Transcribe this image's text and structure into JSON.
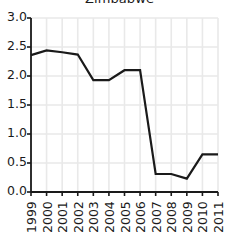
{
  "chart_data": {
    "type": "line",
    "title": "Zimbabwe",
    "xlabel": "",
    "ylabel": "",
    "x": [
      1999,
      2000,
      2001,
      2002,
      2003,
      2004,
      2005,
      2006,
      2007,
      2008,
      2009,
      2010,
      2011
    ],
    "categories": [
      "1999",
      "2000",
      "2001",
      "2002",
      "2003",
      "2004",
      "2005",
      "2006",
      "2007",
      "2008",
      "2009",
      "2010",
      "2011"
    ],
    "values": [
      2.36,
      2.44,
      2.41,
      2.37,
      1.93,
      1.93,
      2.1,
      2.1,
      0.31,
      0.31,
      0.23,
      0.65,
      0.65
    ],
    "series": [
      {
        "name": "Zimbabwe",
        "values": [
          2.36,
          2.44,
          2.41,
          2.37,
          1.93,
          1.93,
          2.1,
          2.1,
          0.31,
          0.31,
          0.23,
          0.65,
          0.65
        ],
        "color": "#1a1a1a"
      }
    ],
    "xlim": [
      1999,
      2011
    ],
    "ylim": [
      0.0,
      3.0
    ],
    "ytick_labels": [
      "0.0",
      "0.5",
      "1.0",
      "1.5",
      "2.0",
      "2.5",
      "3.0"
    ],
    "ytick_values": [
      0.0,
      0.5,
      1.0,
      1.5,
      2.0,
      2.5,
      3.0
    ],
    "xtick_labels": [
      "1999",
      "2000",
      "2001",
      "2002",
      "2003",
      "2004",
      "2005",
      "2006",
      "2007",
      "2008",
      "2009",
      "2010",
      "2011"
    ],
    "grid": true,
    "grid_color": "#e9e9e9",
    "legend": false,
    "legend_position": "none",
    "background_color": "#ffffff",
    "axis_color": "#1a1a1a",
    "line_width": 2.2,
    "xtick_rotation": -90
  }
}
